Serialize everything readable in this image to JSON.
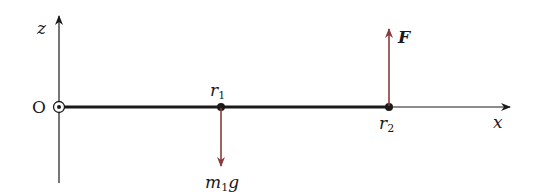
{
  "diagram": {
    "axes": {
      "z_label": "z",
      "x_label": "x",
      "origin_label": "O",
      "origin_symbol": "out-of-page-icon"
    },
    "points": [
      {
        "name": "r",
        "sub": "1",
        "x": 221
      },
      {
        "name": "r",
        "sub": "2",
        "x": 389
      }
    ],
    "forces": [
      {
        "label": "F",
        "direction": "up",
        "at": "r2",
        "color": "#8b3a3a"
      },
      {
        "label_main": "m",
        "label_sub": "1",
        "label_tail": "g",
        "direction": "down",
        "at": "r1",
        "color": "#8b3a3a"
      }
    ],
    "colors": {
      "axis": "#1a1a1a",
      "force": "#8b3a3a"
    }
  }
}
